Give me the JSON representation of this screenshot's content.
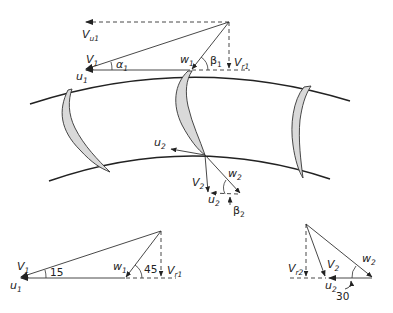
{
  "labels": {
    "inlet": {
      "Vu1": {
        "main": "V",
        "sub": "u1"
      },
      "V1": {
        "main": "V",
        "sub": "1"
      },
      "u1": {
        "main": "u",
        "sub": "1"
      },
      "w1": {
        "main": "w",
        "sub": "1"
      },
      "alpha1": {
        "main": "α",
        "sub": "1"
      },
      "beta1": {
        "main": "β",
        "sub": "1"
      },
      "Vr1": {
        "main": "V",
        "sub": "r1"
      }
    },
    "exit": {
      "u2": {
        "main": "u",
        "sub": "2"
      },
      "V2": {
        "main": "V",
        "sub": "2"
      },
      "w2": {
        "main": "w",
        "sub": "2"
      },
      "u2b": {
        "main": "u",
        "sub": "2"
      },
      "beta2": {
        "main": "β",
        "sub": "2"
      }
    },
    "inlet_numeric": {
      "V1": {
        "main": "V",
        "sub": "1"
      },
      "u1": {
        "main": "u",
        "sub": "1"
      },
      "w1": {
        "main": "w",
        "sub": "1"
      },
      "Vr1": {
        "main": "V",
        "sub": "r1"
      },
      "angle_alpha": "15",
      "angle_beta": "45"
    },
    "exit_numeric": {
      "Vr2": {
        "main": "V",
        "sub": "r2"
      },
      "V2": {
        "main": "V",
        "sub": "2"
      },
      "w2": {
        "main": "w",
        "sub": "2"
      },
      "u2": {
        "main": "u",
        "sub": "2"
      },
      "angle_beta": "30"
    }
  },
  "colors": {
    "line": "#333333",
    "blade_fill": "#d9d9d9",
    "background": "#ffffff"
  }
}
